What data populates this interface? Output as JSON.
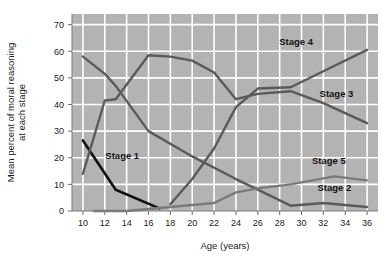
{
  "chart_data": {
    "type": "line",
    "title": "",
    "xlabel": "Age (years)",
    "ylabel": "Mean percent of moral reasoning at each stage",
    "xlim": [
      9,
      37
    ],
    "ylim": [
      0,
      74
    ],
    "xticks": [
      10,
      12,
      14,
      16,
      18,
      20,
      22,
      24,
      26,
      28,
      30,
      32,
      34,
      36
    ],
    "yticks": [
      0,
      10,
      20,
      30,
      40,
      50,
      60,
      70
    ],
    "grid": true,
    "legend": "inline-labels",
    "plot_background": "#b3b3b3",
    "gridline_color": "#ffffff",
    "series": [
      {
        "name": "Stage 1",
        "color": "#111111",
        "label_x": 13.6,
        "label_y": 19.5,
        "x": [
          10,
          13,
          17
        ],
        "values": [
          26.5,
          8.0,
          1.0
        ]
      },
      {
        "name": "Stage 2",
        "color": "#5a5a5a",
        "label_x": 33.0,
        "label_y": 7.5,
        "x": [
          10,
          12,
          13,
          16,
          20,
          24,
          26,
          29,
          32,
          36
        ],
        "values": [
          58.0,
          51.5,
          47.0,
          30.0,
          20.5,
          12.0,
          8.0,
          2.0,
          3.0,
          1.5
        ]
      },
      {
        "name": "Stage 3",
        "color": "#5a5a5a",
        "label_x": 33.2,
        "label_y": 43.0,
        "x": [
          10,
          12,
          13,
          16,
          18,
          20,
          22,
          24,
          26,
          29,
          32,
          36
        ],
        "values": [
          14.0,
          41.5,
          42.0,
          58.5,
          58.0,
          56.5,
          52.0,
          42.0,
          44.0,
          45.0,
          40.5,
          33.0
        ]
      },
      {
        "name": "Stage 4",
        "color": "#5a5a5a",
        "label_x": 29.5,
        "label_y": 62.5,
        "x": [
          18,
          20,
          22,
          24,
          26,
          29,
          32,
          36
        ],
        "values": [
          2.5,
          12.0,
          23.5,
          39.0,
          46.0,
          46.5,
          52.5,
          60.5
        ]
      },
      {
        "name": "Stage 5",
        "color": "#7a7a7a",
        "label_x": 32.5,
        "label_y": 17.5,
        "x": [
          11,
          14,
          18,
          22,
          24,
          26,
          29,
          33,
          36
        ],
        "values": [
          0.0,
          0.0,
          1.5,
          3.0,
          7.0,
          8.5,
          10.0,
          13.0,
          11.5
        ]
      }
    ]
  }
}
